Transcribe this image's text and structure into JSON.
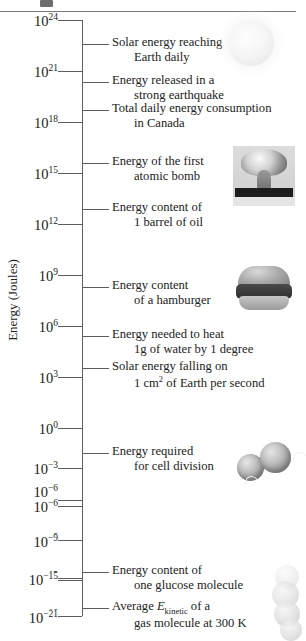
{
  "figure": {
    "axis_title": "Energy (Joules)",
    "scale_type": "logarithmic",
    "decades": [
      {
        "exp": "24",
        "label_base": "10",
        "y": 20
      },
      {
        "exp": "21",
        "label_base": "10",
        "y": 71
      },
      {
        "exp": "18",
        "label_base": "10",
        "y": 122
      },
      {
        "exp": "15",
        "label_base": "10",
        "y": 173
      },
      {
        "exp": "12",
        "label_base": "10",
        "y": 224
      },
      {
        "exp": "9",
        "label_base": "10",
        "y": 275
      },
      {
        "exp": "6",
        "label_base": "10",
        "y": 326
      },
      {
        "exp": "3",
        "label_base": "10",
        "y": 377
      },
      {
        "exp": "0",
        "label_base": "10",
        "y": 428
      },
      {
        "exp": "−3",
        "label_base": "10",
        "y": 479
      },
      {
        "exp": "−6",
        "label_base": "10",
        "y": 530
      },
      {
        "exp": "−9",
        "label_base": "10",
        "y": 581
      },
      {
        "exp": "−12",
        "label_base": "10",
        "y": 632
      },
      {
        "exp": "−15",
        "label_base": "10",
        "y": 683
      },
      {
        "exp": "−18",
        "label_base": "10",
        "y": 734
      },
      {
        "exp": "−21",
        "label_base": "10",
        "y": 785
      }
    ],
    "annotations": [
      {
        "id": "solar-earth",
        "line1": "Solar energy reaching",
        "line2": "Earth daily",
        "tick_y": 44
      },
      {
        "id": "earthquake",
        "line1": "Energy released in a",
        "line2": "strong earthquake",
        "tick_y": 82
      },
      {
        "id": "canada",
        "line1": "Total daily energy consumption",
        "line2": "in Canada",
        "tick_y": 110
      },
      {
        "id": "atomic-bomb",
        "line1": "Energy of the first",
        "line2": "atomic bomb",
        "tick_y": 163
      },
      {
        "id": "barrel-oil",
        "line1": "Energy content of",
        "line2": "1 barrel of oil",
        "tick_y": 209
      },
      {
        "id": "hamburger",
        "line1": "Energy content",
        "line2": "of a hamburger",
        "tick_y": 287
      },
      {
        "id": "heat-water",
        "line1": "Energy needed to heat",
        "line2": "1g of water by 1 degree",
        "tick_y": 336
      },
      {
        "id": "solar-cm2",
        "line1": "Solar energy falling on",
        "line2": "1 cm2 of Earth per second",
        "tick_y": 368
      },
      {
        "id": "cell-division",
        "line1": "Energy required",
        "line2": "for cell division",
        "tick_y": 453
      },
      {
        "id": "glucose",
        "line1": "Energy content of",
        "line2": "one glucose molecule",
        "tick_y": 572
      },
      {
        "id": "gas-molecule",
        "line1": "Average Ekinetic of a",
        "line2": "gas molecule at 300 K",
        "tick_y": 608
      }
    ],
    "photos": [
      {
        "id": "sun-photo",
        "caption_ref": "solar-earth"
      },
      {
        "id": "atomic-bomb-photo",
        "caption_ref": "atomic-bomb"
      },
      {
        "id": "hamburger-photo",
        "caption_ref": "hamburger"
      },
      {
        "id": "dividing-cell-photo",
        "caption_ref": "cell-division"
      },
      {
        "id": "molecule-photo",
        "caption_ref": "gas-molecule"
      }
    ]
  }
}
